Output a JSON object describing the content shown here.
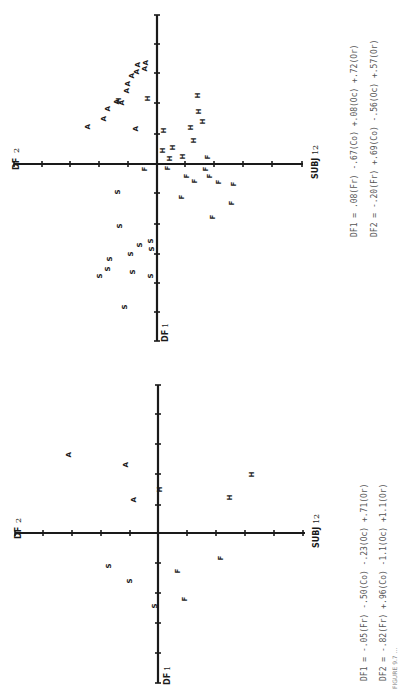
{
  "page": {
    "orientation": "rotated-90-ccw",
    "caption": "FIGURE 9.7 ..."
  },
  "chart_data": [
    {
      "type": "scatter",
      "title": "SUBJ 12",
      "xlabel": "DF 1",
      "ylabel": "DF 2",
      "subject_label": "SUBJ",
      "subject_number": "12",
      "df1_label": "DF",
      "df1_number": "1",
      "df2_label": "DF",
      "df2_number": "2",
      "grid": false,
      "origin_px": [
        157,
        164
      ],
      "tick_px": 29.5,
      "h_axis": {
        "x1": 14,
        "x2": 303,
        "y": 164,
        "ticks": [
          14,
          42,
          70,
          99,
          128,
          157,
          185,
          214,
          243,
          272,
          302
        ]
      },
      "v_axis": {
        "x": 157,
        "y1": 15,
        "y2": 341,
        "ticks": [
          15,
          44,
          73,
          103,
          134,
          164,
          193,
          224,
          254,
          283,
          312,
          341
        ]
      },
      "series": [
        {
          "name": "A",
          "points": [
            [
              87,
              127
            ],
            [
              103,
              119
            ],
            [
              107,
              109
            ],
            [
              116,
              102
            ],
            [
              121,
              103
            ],
            [
              126,
              91
            ],
            [
              127,
              84
            ],
            [
              131,
              76
            ],
            [
              136,
              72
            ],
            [
              144,
              69
            ],
            [
              145,
              63
            ],
            [
              137,
              65
            ],
            [
              135,
              129
            ]
          ]
        },
        {
          "name": "H",
          "points": [
            [
              118,
              101
            ],
            [
              147,
              99
            ],
            [
              163,
              131
            ],
            [
              162,
              151
            ],
            [
              172,
              148
            ],
            [
              169,
              159
            ],
            [
              182,
              157
            ],
            [
              190,
              128
            ],
            [
              193,
              141
            ],
            [
              197,
              96
            ],
            [
              198,
              112
            ],
            [
              202,
              122
            ]
          ]
        },
        {
          "name": "F",
          "points": [
            [
              144,
              169
            ],
            [
              167,
              168
            ],
            [
              207,
              157
            ],
            [
              186,
              176
            ],
            [
              194,
              181
            ],
            [
              205,
              169
            ],
            [
              209,
              176
            ],
            [
              218,
              182
            ],
            [
              233,
              184
            ],
            [
              181,
              197
            ],
            [
              231,
              203
            ],
            [
              212,
              217
            ]
          ]
        },
        {
          "name": "S",
          "points": [
            [
              117,
              192
            ],
            [
              119,
              226
            ],
            [
              139,
              245
            ],
            [
              150,
              241
            ],
            [
              151,
              249
            ],
            [
              130,
              254
            ],
            [
              109,
              259
            ],
            [
              107,
              269
            ],
            [
              99,
              276
            ],
            [
              132,
              272
            ],
            [
              150,
              276
            ],
            [
              124,
              307
            ]
          ]
        }
      ],
      "equations": {
        "df1": "DF1 = .08(Fr) -.67(Co) +.08(Oc) +.72(Or)",
        "df2": "DF2 = -.20(Fr) +.69(Co) -.56(Oc) +.57(Or)"
      },
      "coefficients": {
        "DF1": {
          "Fr": 0.08,
          "Co": -0.67,
          "Oc": 0.08,
          "Or": 0.72
        },
        "DF2": {
          "Fr": -0.2,
          "Co": 0.69,
          "Oc": -0.56,
          "Or": 0.57
        }
      }
    },
    {
      "type": "scatter",
      "title": "SUBJ 12",
      "xlabel": "DF 1",
      "ylabel": "DF 2",
      "subject_label": "SUBJ",
      "subject_number": "12",
      "df1_label": "DF",
      "df1_number": "1",
      "df2_label": "DF",
      "df2_number": "2",
      "grid": false,
      "origin_px": [
        158,
        533
      ],
      "tick_px": 29.5,
      "h_axis": {
        "x1": 15,
        "x2": 305,
        "y": 533,
        "ticks": [
          15,
          43,
          72,
          101,
          130,
          158,
          187,
          216,
          245,
          274,
          303
        ]
      },
      "v_axis": {
        "x": 158,
        "y1": 385,
        "y2": 683,
        "ticks": [
          385,
          414,
          444,
          474,
          505,
          533,
          563,
          593,
          623,
          653,
          683
        ]
      },
      "series": [
        {
          "name": "A",
          "points": [
            [
              68,
              455
            ],
            [
              125,
              465
            ],
            [
              133,
              500
            ]
          ]
        },
        {
          "name": "H",
          "points": [
            [
              159,
              490
            ],
            [
              229,
              498
            ],
            [
              251,
              475
            ]
          ]
        },
        {
          "name": "S",
          "points": [
            [
              108,
              566
            ],
            [
              129,
              581
            ],
            [
              154,
              606
            ]
          ]
        },
        {
          "name": "F",
          "points": [
            [
              177,
              571
            ],
            [
              184,
              599
            ],
            [
              220,
              558
            ]
          ]
        }
      ],
      "equations": {
        "df1": "DF1 = -.05(Fr) -.50(Co) -.23(Oc) +.71(Or)",
        "df2": "DF2 = -.82(Fr) +.96(Co) -1.1(Oc) +1.1(Or)"
      },
      "coefficients": {
        "DF1": {
          "Fr": -0.05,
          "Co": -0.5,
          "Oc": -0.23,
          "Or": 0.71
        },
        "DF2": {
          "Fr": -0.82,
          "Co": 0.96,
          "Oc": -1.1,
          "Or": 1.1
        }
      }
    }
  ]
}
